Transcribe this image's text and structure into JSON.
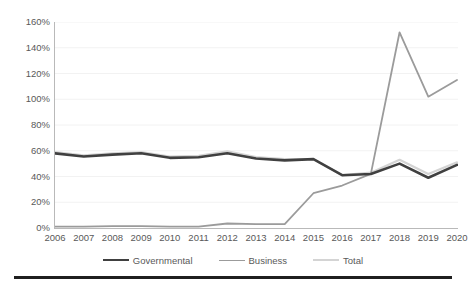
{
  "chart_data": {
    "type": "line",
    "title": "",
    "xlabel": "",
    "ylabel": "",
    "categories": [
      "2006",
      "2007",
      "2008",
      "2009",
      "2010",
      "2011",
      "2012",
      "2013",
      "2014",
      "2015",
      "2016",
      "2017",
      "2018",
      "2019",
      "2020"
    ],
    "x": [
      2006,
      2007,
      2008,
      2009,
      2010,
      2011,
      2012,
      2013,
      2014,
      2015,
      2016,
      2017,
      2018,
      2019,
      2020
    ],
    "ylim": [
      0,
      160
    ],
    "xlim": [
      2006,
      2020
    ],
    "y_tick_labels": [
      "0%",
      "20%",
      "40%",
      "60%",
      "80%",
      "100%",
      "120%",
      "140%",
      "160%"
    ],
    "y_tick_values": [
      0,
      20,
      40,
      60,
      80,
      100,
      120,
      140,
      160
    ],
    "grid": true,
    "legend_position": "bottom",
    "series": [
      {
        "name": "Governmental",
        "color": "#404040",
        "width": 2.6,
        "values": [
          58,
          55.5,
          57,
          58,
          54.5,
          55,
          58,
          54,
          52.5,
          53.5,
          41,
          42,
          50,
          39,
          49
        ]
      },
      {
        "name": "Business",
        "color": "#9b9b9b",
        "width": 1.8,
        "values": [
          1,
          1,
          1.5,
          1.5,
          1,
          1,
          3.5,
          3,
          3,
          27,
          33,
          42,
          152,
          102,
          115
        ]
      },
      {
        "name": "Total",
        "color": "#d4d4d4",
        "width": 2.2,
        "values": [
          59,
          56.5,
          58,
          59,
          55.5,
          56,
          59.5,
          55,
          53.5,
          53.5,
          41,
          43,
          53,
          42,
          51
        ]
      }
    ]
  },
  "legend": {
    "items": [
      {
        "label": "Governmental",
        "color": "#404040",
        "width": 2.6
      },
      {
        "label": "Business",
        "color": "#9b9b9b",
        "width": 1.8
      },
      {
        "label": "Total",
        "color": "#d4d4d4",
        "width": 2.2
      }
    ]
  }
}
